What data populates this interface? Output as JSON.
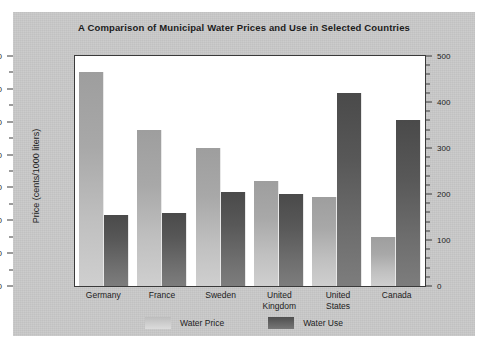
{
  "chart_data": {
    "type": "bar",
    "title": "A Comparison of Municipal Water Prices and Use in Selected Countries",
    "categories": [
      "Germany",
      "France",
      "Sweden",
      "United Kingdom",
      "United States",
      "Canada"
    ],
    "series": [
      {
        "name": "Water Price",
        "axis": "left",
        "unit": "cents/1000 liters",
        "values": [
          130,
          95,
          84,
          64,
          54,
          30
        ],
        "color": "#b4b4b4"
      },
      {
        "name": "Water Use",
        "axis": "right",
        "unit": "liters/person/day",
        "values": [
          155,
          158,
          205,
          200,
          420,
          360
        ],
        "color": "#5a5a5a"
      }
    ],
    "xlabel": "",
    "ylabel": "Price (cents/1000 liters)",
    "y2label": "Use (liters/person/day)",
    "ylim": [
      0,
      140
    ],
    "y2lim": [
      0,
      500
    ],
    "yticks": [
      0,
      20,
      40,
      60,
      80,
      100,
      120,
      140
    ],
    "y2ticks": [
      0,
      100,
      200,
      300,
      400,
      500
    ],
    "grid": false,
    "legend_position": "bottom"
  },
  "left_axis": {
    "label": "Price (cents/1000 liters)",
    "ticks": [
      "0",
      "20",
      "40",
      "60",
      "80",
      "100",
      "120",
      "140"
    ]
  },
  "right_axis": {
    "label": "Use (liters/person/day)",
    "ticks": [
      "0",
      "100",
      "200",
      "300",
      "400",
      "500"
    ]
  },
  "legend": {
    "items": [
      {
        "label": "Water Price"
      },
      {
        "label": "Water Use"
      }
    ]
  },
  "colors": {
    "panel": "#c8c8c8",
    "plot_background": "#ffffff",
    "axis": "#3a3a3a",
    "price_bar": "#b4b4b4",
    "use_bar": "#5a5a5a",
    "text": "#1c1c1c"
  }
}
